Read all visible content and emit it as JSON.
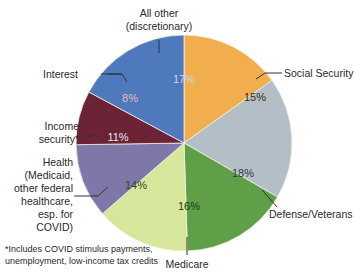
{
  "chart_data": {
    "type": "pie",
    "title": "",
    "slices": [
      {
        "label": "Social Security",
        "value": 15,
        "display": "15%",
        "color": "#F2AE4C"
      },
      {
        "label": "Defense/Veterans",
        "value": 18,
        "display": "18%",
        "color": "#B4BEC6"
      },
      {
        "label": "Medicare",
        "value": 16,
        "display": "16%",
        "color": "#5E9F48"
      },
      {
        "label": "Health (Medicaid, other federal healthcare, esp. for COVID)",
        "value": 14,
        "display": "14%",
        "color": "#D6E69A"
      },
      {
        "label": "Income security*",
        "value": 11,
        "display": "11%",
        "color": "#7E78A8"
      },
      {
        "label": "Interest",
        "value": 8,
        "display": "8%",
        "color": "#6B2335"
      },
      {
        "label": "All other (discretionary)",
        "value": 17,
        "display": "17%",
        "color": "#4F79BD"
      }
    ],
    "footnote": "*Includes COVID stimulus payments, unemployment, low-income tax credits"
  },
  "labels": {
    "all_other_1": "All other",
    "all_other_2": "(discretionary)",
    "interest": "Interest",
    "income_1": "Income",
    "income_2": "security*",
    "health_1": "Health",
    "health_2": "(Medicaid,",
    "health_3": "other federal",
    "health_4": "healthcare,",
    "health_5": "esp. for",
    "health_6": "COVID)",
    "social_security": "Social Security",
    "defense": "Defense/Veterans",
    "medicare": "Medicare",
    "footnote_1": "*Includes COVID stimulus payments,",
    "footnote_2": "unemployment, low-income tax credits"
  },
  "pcts": {
    "ss": "15%",
    "def": "18%",
    "med": "16%",
    "health": "14%",
    "income": "11%",
    "interest": "8%",
    "other": "17%"
  }
}
